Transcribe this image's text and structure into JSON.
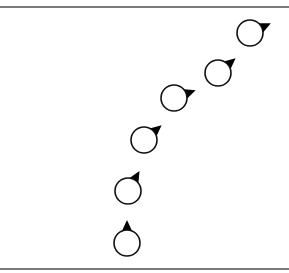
{
  "diagram": {
    "colors": {
      "stroke": "#111111",
      "fill": "#ffffff",
      "pointer": "#000000",
      "rule": "#7a7a7a"
    },
    "circle_radius": 13,
    "markers": [
      {
        "cx": 127,
        "cy": 243,
        "angle_deg": 0
      },
      {
        "cx": 128,
        "cy": 191,
        "angle_deg": 30
      },
      {
        "cx": 144,
        "cy": 140,
        "angle_deg": 50
      },
      {
        "cx": 174,
        "cy": 98,
        "angle_deg": 70
      },
      {
        "cx": 218,
        "cy": 73,
        "angle_deg": 50
      },
      {
        "cx": 250,
        "cy": 33,
        "angle_deg": 65
      }
    ]
  }
}
